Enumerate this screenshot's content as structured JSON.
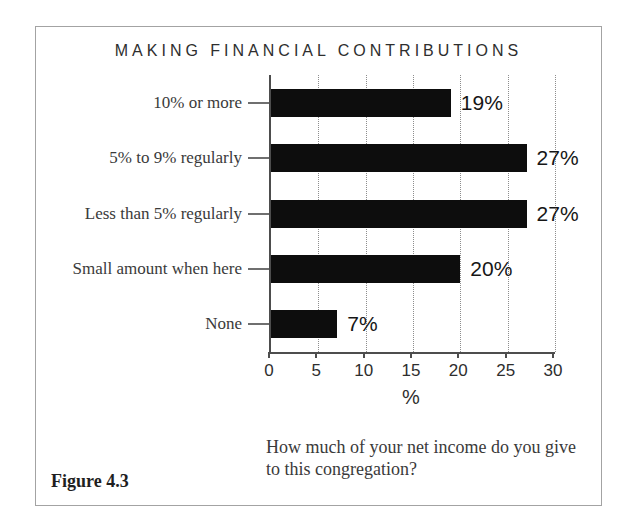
{
  "figure": {
    "label": "Figure 4.3",
    "caption_lines": [
      "How much of your net income do you give",
      "to this congregation?"
    ]
  },
  "chart_data": {
    "type": "bar",
    "orientation": "horizontal",
    "title": "MAKING FINANCIAL CONTRIBUTIONS",
    "categories": [
      "10% or more",
      "5% to 9% regularly",
      "Less than 5% regularly",
      "Small amount when here",
      "None"
    ],
    "values": [
      19,
      27,
      27,
      20,
      7
    ],
    "value_labels": [
      "19%",
      "27%",
      "27%",
      "20%",
      "7%"
    ],
    "xlabel": "%",
    "xlim": [
      0,
      30
    ],
    "xticks": [
      0,
      5,
      10,
      15,
      20,
      25,
      30
    ],
    "grid": "vertical-dotted",
    "legend": "none",
    "bar_color": "#0d0d0d",
    "axis_color": "#4d4d4d",
    "grid_color": "#8d8d8d"
  }
}
